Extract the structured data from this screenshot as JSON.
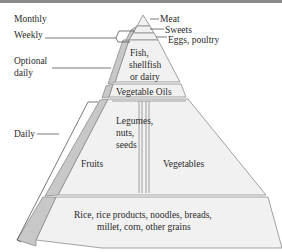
{
  "diagram": {
    "frequency_labels": {
      "monthly": "Monthly",
      "weekly": "Weekly",
      "optional_daily_1": "Optional",
      "optional_daily_2": "daily",
      "daily": "Daily"
    },
    "tiers": {
      "meat": "Meat",
      "sweets": "Sweets",
      "eggs_poultry": "Eggs, poultry",
      "fish_1": "Fish,",
      "fish_2": "shellfish",
      "fish_3": "or dairy",
      "vegetable_oils": "Vegetable Oils",
      "fruits": "Fruits",
      "legumes_1": "Legumes,",
      "legumes_2": "nuts,",
      "legumes_3": "seeds",
      "vegetables": "Vegetables",
      "grains_1": "Rice, rice products, noodles, breads,",
      "grains_2": "millet, corn, other grains"
    },
    "colors": {
      "face": "#f1f1f1",
      "side": "#c8c8c8",
      "outline": "#8c8c8c",
      "text": "#2a2a2a"
    }
  }
}
